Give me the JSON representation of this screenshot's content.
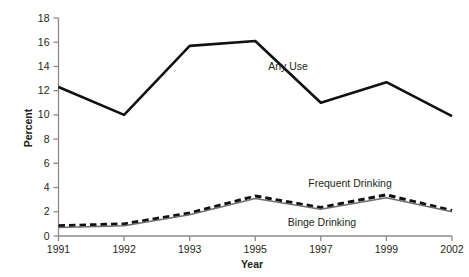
{
  "chart_data": {
    "type": "line",
    "title": "",
    "xlabel": "Year",
    "ylabel": "Percent",
    "categories": [
      "1991",
      "1992",
      "1993",
      "1995",
      "1997",
      "1999",
      "2002"
    ],
    "ylim": [
      0,
      18
    ],
    "y_ticks": [
      0,
      2,
      4,
      6,
      8,
      10,
      12,
      14,
      16,
      18
    ],
    "y_tick_labels": [
      "0",
      "2",
      "4",
      "6",
      "8",
      "10",
      "12",
      "14",
      "16",
      "18"
    ],
    "grid": false,
    "legend_position": "inline-annotations",
    "series": [
      {
        "name": "Any Use",
        "style": "solid-thick-black",
        "color": "#111111",
        "values": [
          12.3,
          10.0,
          15.7,
          16.1,
          11.0,
          12.7,
          9.9
        ]
      },
      {
        "name": "Frequent Drinking",
        "style": "dashed-thick-black",
        "color": "#111111",
        "values": [
          0.85,
          1.0,
          1.9,
          3.3,
          2.35,
          3.4,
          2.1
        ]
      },
      {
        "name": "Binge Drinking",
        "style": "solid-thin-gray",
        "color": "#6e6e6e",
        "values": [
          0.7,
          0.85,
          1.75,
          3.1,
          2.2,
          3.15,
          2.0
        ]
      }
    ],
    "annotations": [
      {
        "text": "Any Use",
        "series": "Any Use",
        "x_px": 288,
        "y_px": 70
      },
      {
        "text": "Frequent Drinking",
        "series": "Frequent Drinking",
        "x_px": 350,
        "y_px": 187
      },
      {
        "text": "Binge Drinking",
        "series": "Binge Drinking",
        "x_px": 322,
        "y_px": 226
      }
    ]
  },
  "axes": {
    "y_title": "Percent",
    "x_title": "Year"
  },
  "colors": {
    "background": "#ffffff",
    "axis": "#8a8a8a",
    "text": "#231f20",
    "primary_line": "#111111",
    "secondary_line": "#6e6e6e"
  }
}
